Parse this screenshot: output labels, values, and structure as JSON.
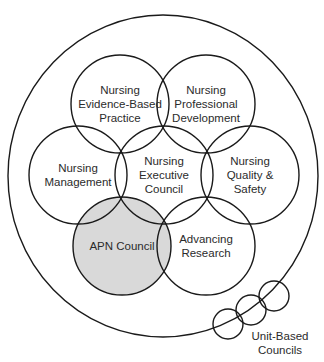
{
  "diagram": {
    "type": "overlapping-circles",
    "outer": {
      "cx": 163,
      "cy": 176,
      "rx": 155,
      "ry": 161
    },
    "highlight_color": "#d9d9d9",
    "stroke_color": "#1a1a1a",
    "councils": [
      {
        "id": "ebp",
        "lines": [
          "Nursing",
          "Evidence-Based",
          "Practice"
        ],
        "cx": 120,
        "cy": 104,
        "r": 49,
        "highlight": false
      },
      {
        "id": "pd",
        "lines": [
          "Nursing",
          "Professional",
          "Development"
        ],
        "cx": 206,
        "cy": 104,
        "r": 49,
        "highlight": false
      },
      {
        "id": "mgmt",
        "lines": [
          "Nursing",
          "Management"
        ],
        "cx": 78,
        "cy": 175,
        "r": 49,
        "highlight": false
      },
      {
        "id": "exec",
        "lines": [
          "Nursing",
          "Executive",
          "Council"
        ],
        "cx": 164,
        "cy": 175,
        "r": 49,
        "highlight": false
      },
      {
        "id": "qs",
        "lines": [
          "Nursing",
          "Quality &",
          "Safety"
        ],
        "cx": 250,
        "cy": 175,
        "r": 49,
        "highlight": false
      },
      {
        "id": "apn",
        "lines": [
          "APN Council"
        ],
        "cx": 122,
        "cy": 246,
        "r": 49,
        "highlight": true
      },
      {
        "id": "research",
        "lines": [
          "Advancing",
          "Research"
        ],
        "cx": 206,
        "cy": 246,
        "r": 49,
        "highlight": false
      }
    ],
    "unit_based": {
      "label_lines": [
        "Unit-Based",
        "Councils"
      ],
      "circles": [
        {
          "cx": 228,
          "cy": 324,
          "r": 15
        },
        {
          "cx": 251,
          "cy": 310,
          "r": 15
        },
        {
          "cx": 274,
          "cy": 296,
          "r": 15
        }
      ]
    }
  }
}
